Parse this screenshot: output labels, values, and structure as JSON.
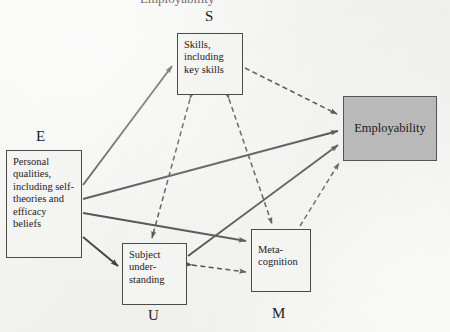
{
  "figure": {
    "cropped_caption": "Employability",
    "background_color": "#f1f1ef",
    "ink_color": "#2b2b2b",
    "highlight_fill": "#b9b9b9"
  },
  "nodes": {
    "personal_qualities": {
      "tag": "E",
      "label": "Personal qualities, including self-theories and efficacy beliefs",
      "filled": "no"
    },
    "skills": {
      "tag": "S",
      "label": "Skills, including key skills",
      "filled": "no"
    },
    "subject_understanding": {
      "tag": "U",
      "label": "Subject under-standing",
      "filled": "no"
    },
    "metacognition": {
      "tag": "M",
      "label": "Meta-cognition",
      "filled": "no"
    },
    "employability": {
      "tag": "",
      "label": "Employability",
      "filled": "yes"
    }
  },
  "edges": [
    {
      "from": "E",
      "to": "S",
      "style": "solid",
      "direction": "one-way"
    },
    {
      "from": "E",
      "to": "Employability",
      "style": "solid",
      "direction": "one-way"
    },
    {
      "from": "E",
      "to": "M",
      "style": "solid",
      "direction": "one-way"
    },
    {
      "from": "E",
      "to": "U",
      "style": "solid",
      "direction": "one-way"
    },
    {
      "from": "U",
      "to": "Employability",
      "style": "solid",
      "direction": "one-way"
    },
    {
      "from": "S",
      "to": "Employability",
      "style": "dashed",
      "direction": "one-way"
    },
    {
      "from": "M",
      "to": "Employability",
      "style": "dashed",
      "direction": "one-way"
    },
    {
      "from": "S",
      "to": "U",
      "style": "dashed",
      "direction": "two-way"
    },
    {
      "from": "S",
      "to": "M",
      "style": "dashed",
      "direction": "two-way"
    },
    {
      "from": "U",
      "to": "M",
      "style": "dashed",
      "direction": "two-way"
    }
  ]
}
